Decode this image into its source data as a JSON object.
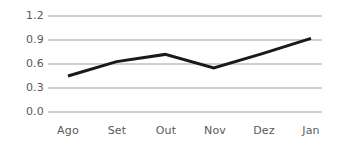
{
  "chart_data": {
    "type": "line",
    "title": "",
    "subtitle": "",
    "xlabel": "",
    "ylabel": "",
    "categories": [
      "Ago",
      "Set",
      "Out",
      "Nov",
      "Dez",
      "Jan"
    ],
    "values": [
      0.45,
      0.63,
      0.72,
      0.55,
      0.73,
      0.92
    ],
    "series": [
      {
        "name": "",
        "values": [
          0.45,
          0.63,
          0.72,
          0.55,
          0.73,
          0.92
        ]
      }
    ],
    "ylim": [
      0.0,
      1.2
    ],
    "ytick_labels": [
      "0.0",
      "0.3",
      "0.6",
      "0.9",
      "1.2"
    ],
    "ytick_values": [
      0.0,
      0.3,
      0.6,
      0.9,
      1.2
    ],
    "xtick_labels": [
      "Ago",
      "Set",
      "Out",
      "Nov",
      "Dez",
      "Jan"
    ],
    "grid": true,
    "grid_axis": "y",
    "legend": false,
    "legend_position": "none",
    "markers": false,
    "annotations": []
  },
  "style": {
    "background_color": "#ffffff",
    "line_color": "#1a1a1a",
    "grid_color": "#bfbfbf",
    "tick_label_color": "#595959",
    "line_width": 3
  }
}
